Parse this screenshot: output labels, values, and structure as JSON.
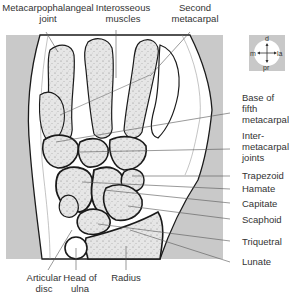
{
  "figure": {
    "type": "anatomical-diagram",
    "colors": {
      "background_panel": "#c9c9c9",
      "bone_fill": "#e4e4e4",
      "soft_tissue": "#ffffff",
      "outline": "#1a1a1a",
      "leader_line": "#555555"
    }
  },
  "labels_top": [
    {
      "id": "mcp-joint",
      "lines": [
        "Metacarpophalangeal",
        "joint"
      ]
    },
    {
      "id": "interosseous",
      "lines": [
        "Interosseous",
        "muscles"
      ]
    },
    {
      "id": "second-metacarpal",
      "lines": [
        "Second",
        "metacarpal"
      ]
    }
  ],
  "labels_right": [
    {
      "id": "base-fifth-metacarpal",
      "lines": [
        "Base of",
        "fifth",
        "metacarpal"
      ]
    },
    {
      "id": "intermetacarpal-joints",
      "lines": [
        "Inter-",
        "metacarpal",
        "joints"
      ]
    },
    {
      "id": "trapezoid",
      "lines": [
        "Trapezoid"
      ]
    },
    {
      "id": "hamate",
      "lines": [
        "Hamate"
      ]
    },
    {
      "id": "capitate",
      "lines": [
        "Capitate"
      ]
    },
    {
      "id": "scaphoid",
      "lines": [
        "Scaphoid"
      ]
    },
    {
      "id": "triquetral",
      "lines": [
        "Triquetral"
      ]
    },
    {
      "id": "lunate",
      "lines": [
        "Lunate"
      ]
    }
  ],
  "labels_bottom": [
    {
      "id": "articular-disc",
      "lines": [
        "Articular",
        "disc"
      ]
    },
    {
      "id": "head-of-ulna",
      "lines": [
        "Head of",
        "ulna"
      ]
    },
    {
      "id": "radius",
      "lines": [
        "Radius"
      ]
    }
  ],
  "compass": {
    "top": "d",
    "bottom": "pr",
    "left": "m",
    "right": "la",
    "icon": "orientation-compass-icon"
  }
}
